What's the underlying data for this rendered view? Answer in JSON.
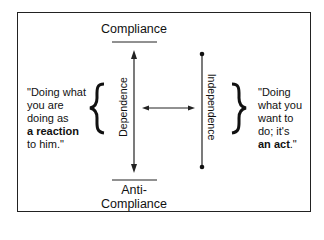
{
  "diagram": {
    "top_label": "Compliance",
    "bottom_label_line1": "Anti-",
    "bottom_label_line2": "Compliance",
    "left_axis_label": "Dependence",
    "right_axis_label": "Independence",
    "left_quote": {
      "line1": "\"Doing what",
      "line2": "you are",
      "line3": "doing as",
      "line4_bold": "a reaction",
      "line5": "to him.\""
    },
    "right_quote": {
      "line1": "\"Doing",
      "line2": "what you",
      "line3": "want to",
      "line4": "do; it's",
      "line5_bold": "an act",
      "line5_end": ".\""
    },
    "colors": {
      "line": "#222222",
      "text": "#111111",
      "background": "#ffffff"
    }
  }
}
